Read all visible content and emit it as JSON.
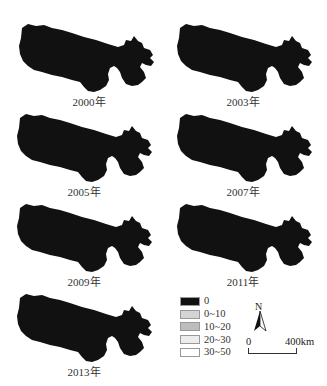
{
  "figure": {
    "panels": [
      {
        "year_label": "2000年"
      },
      {
        "year_label": "2003年"
      },
      {
        "year_label": "2005年"
      },
      {
        "year_label": "2007年"
      },
      {
        "year_label": "2009年"
      },
      {
        "year_label": "2011年"
      },
      {
        "year_label": "2013年"
      }
    ],
    "legend": {
      "items": [
        {
          "label": "0",
          "color": "#111111"
        },
        {
          "label": "0~10",
          "color": "#d4d4d4"
        },
        {
          "label": "10~20",
          "color": "#bdbdbd"
        },
        {
          "label": "20~30",
          "color": "#ececec"
        },
        {
          "label": "30~50",
          "color": "#ffffff"
        }
      ]
    },
    "north_arrow": {
      "label": "N"
    },
    "scale_bar": {
      "start": "0",
      "end": "400km"
    }
  }
}
